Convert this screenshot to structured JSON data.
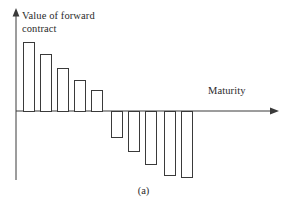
{
  "figure": {
    "caption": "(a)",
    "background_color": "#ffffff",
    "line_color": "#3a3a3a",
    "text_color": "#2b2b2b"
  },
  "chart_data": {
    "type": "bar",
    "title": "",
    "subtitle": "",
    "ylabel": "Value of forward\ncontract",
    "xlabel": "Maturity",
    "grid": false,
    "legend": null,
    "axis_origin_px": {
      "x": 16,
      "y": 111
    },
    "x_axis_arrow_end_px": 278,
    "y_axis_arrow_top_px": 9,
    "categories": [
      1,
      2,
      3,
      4,
      5,
      6,
      7,
      8,
      9,
      10
    ],
    "values": [
      68,
      56,
      42,
      30,
      20,
      -26,
      -40,
      -58,
      -72,
      -74
    ],
    "ylim": [
      -80,
      75
    ],
    "xlim": [
      0,
      10.8
    ],
    "bars_px": [
      {
        "index": 1,
        "x": 23,
        "width": 11,
        "top": 42,
        "bottom": 111,
        "sign": "positive"
      },
      {
        "index": 2,
        "x": 40,
        "width": 11,
        "top": 54,
        "bottom": 111,
        "sign": "positive"
      },
      {
        "index": 3,
        "x": 57,
        "width": 11,
        "top": 68,
        "bottom": 111,
        "sign": "positive"
      },
      {
        "index": 4,
        "x": 74,
        "width": 11,
        "top": 80,
        "bottom": 111,
        "sign": "positive"
      },
      {
        "index": 5,
        "x": 91,
        "width": 11,
        "top": 90,
        "bottom": 111,
        "sign": "positive"
      },
      {
        "index": 6,
        "x": 111,
        "width": 11,
        "top": 111,
        "bottom": 137,
        "sign": "negative"
      },
      {
        "index": 7,
        "x": 128,
        "width": 11,
        "top": 111,
        "bottom": 151,
        "sign": "negative"
      },
      {
        "index": 8,
        "x": 145,
        "width": 11,
        "top": 111,
        "bottom": 164,
        "sign": "negative"
      },
      {
        "index": 9,
        "x": 164,
        "width": 11,
        "top": 111,
        "bottom": 175,
        "sign": "negative"
      },
      {
        "index": 10,
        "x": 181,
        "width": 11,
        "top": 111,
        "bottom": 177,
        "sign": "negative"
      }
    ]
  }
}
